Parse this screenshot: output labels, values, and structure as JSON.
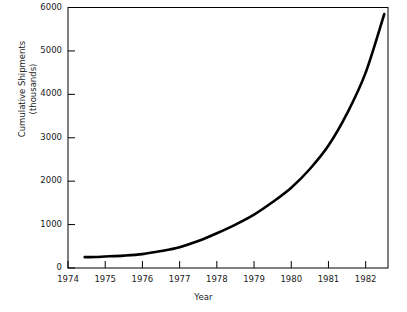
{
  "chart_data": {
    "type": "line",
    "title": "",
    "xlabel": "Year",
    "ylabel": "Cumulative Shipments (thousands)",
    "ylabel_line1": "Cumulative Shipments",
    "ylabel_line2": "(thousands)",
    "xlim": [
      1974,
      1982.6
    ],
    "ylim": [
      0,
      6000
    ],
    "xticks": [
      1974,
      1975,
      1976,
      1977,
      1978,
      1979,
      1980,
      1981,
      1982
    ],
    "xtick_labels": [
      "1974",
      "1975",
      "1976",
      "1977",
      "1978",
      "1979",
      "1980",
      "1981",
      "1982"
    ],
    "yticks": [
      0,
      1000,
      2000,
      3000,
      4000,
      5000,
      6000
    ],
    "ytick_labels": [
      "0",
      "1000",
      "2000",
      "3000",
      "4000",
      "5000",
      "6000"
    ],
    "grid": false,
    "legend": false,
    "line_color": "#000000",
    "line_width": 2.6,
    "series": [
      {
        "name": "Cumulative Shipments",
        "x": [
          1974.45,
          1974.75,
          1975.0,
          1975.5,
          1976.0,
          1976.5,
          1977.0,
          1977.5,
          1978.0,
          1978.5,
          1979.0,
          1979.5,
          1980.0,
          1980.5,
          1981.0,
          1981.5,
          1982.0,
          1982.5
        ],
        "values": [
          250,
          255,
          265,
          285,
          320,
          390,
          480,
          620,
          800,
          1000,
          1230,
          1520,
          1850,
          2280,
          2820,
          3560,
          4500,
          5850
        ]
      }
    ]
  },
  "axes": {
    "frame_color": "#000000",
    "background": "#ffffff"
  }
}
